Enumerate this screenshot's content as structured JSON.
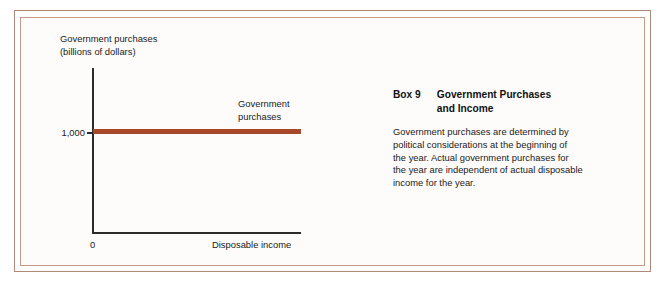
{
  "figure": {
    "background_color": "#fdfcfb",
    "frame_color_outer": "#b08878",
    "frame_color_inner": "#c49a88"
  },
  "chart_data": {
    "type": "line",
    "title": "",
    "ylabel": "Government purchases\n(billions of dollars)",
    "xlabel": "Disposable income",
    "x_origin_label": "0",
    "y_tick_labels": [
      "1,000"
    ],
    "y_tick_values": [
      1000
    ],
    "x_tick_labels": [],
    "grid": false,
    "legend_position": "inline-right",
    "series": [
      {
        "name": "Government purchases",
        "label": "Government\npurchases",
        "color": "#a8482a",
        "x": [
          0,
          100
        ],
        "values": [
          1000,
          1000
        ]
      }
    ],
    "ylim": [
      0,
      1400
    ],
    "xlim": [
      0,
      100
    ],
    "annotations": []
  },
  "box": {
    "number": "Box 9",
    "title": "Government Purchases\nand Income",
    "body": "Government purchases are determined by\npolitical considerations at the beginning of\nthe year. Actual government purchases for\nthe year are independent of actual disposable\nincome for the year."
  }
}
